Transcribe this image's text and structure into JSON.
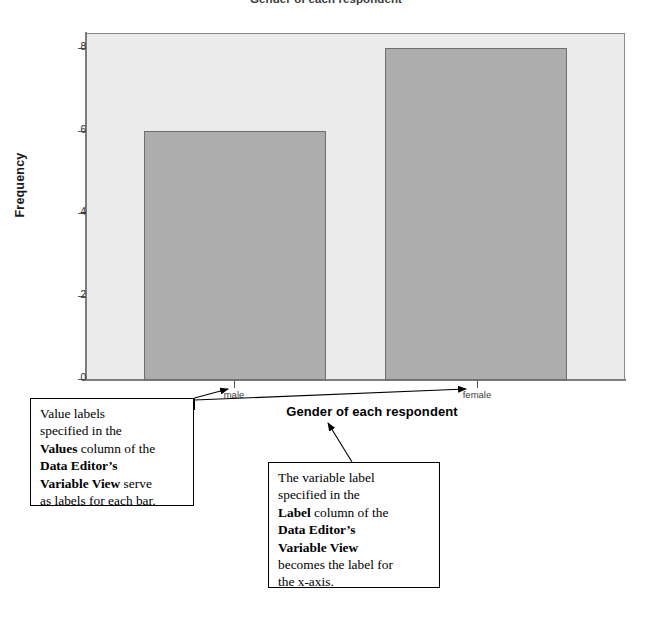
{
  "chart_data": {
    "type": "bar",
    "title": "Gender of each respondent",
    "xlabel": "Gender of each respondent",
    "ylabel": "Frequency",
    "categories": [
      "male",
      "female"
    ],
    "values": [
      6,
      8
    ],
    "yticks": [
      "0",
      "2",
      "4",
      "6",
      "8"
    ],
    "ytick_values": [
      0,
      2,
      4,
      6,
      8
    ],
    "ylim": [
      0,
      8.35
    ],
    "grid": false,
    "legend": "none",
    "bar_color": "#adadad",
    "bar_border_color": "#6f6f6f",
    "plot_background": "#ebebeb"
  },
  "annotations": {
    "left_callout": {
      "name": "value-labels-callout",
      "lines": [
        {
          "runs": [
            {
              "text": "Value labels",
              "bold": false
            }
          ]
        },
        {
          "runs": [
            {
              "text": "specified in the",
              "bold": false
            }
          ]
        },
        {
          "runs": [
            {
              "text": "Values",
              "bold": true
            },
            {
              "text": " column of the",
              "bold": false
            }
          ]
        },
        {
          "runs": [
            {
              "text": "Data Editor’s",
              "bold": true
            }
          ]
        },
        {
          "runs": [
            {
              "text": "Variable View",
              "bold": true
            },
            {
              "text": " serve",
              "bold": false
            }
          ]
        },
        {
          "runs": [
            {
              "text": "as labels for each bar.",
              "bold": false
            }
          ]
        }
      ]
    },
    "right_callout": {
      "name": "variable-label-callout",
      "lines": [
        {
          "runs": [
            {
              "text": "The variable label",
              "bold": false
            }
          ]
        },
        {
          "runs": [
            {
              "text": "specified in the",
              "bold": false
            }
          ]
        },
        {
          "runs": [
            {
              "text": "Label",
              "bold": true
            },
            {
              "text": " column of the",
              "bold": false
            }
          ]
        },
        {
          "runs": [
            {
              "text": "Data Editor’s",
              "bold": true
            }
          ]
        },
        {
          "runs": [
            {
              "text": "Variable View",
              "bold": true
            }
          ]
        },
        {
          "runs": [
            {
              "text": "becomes the label for",
              "bold": false
            }
          ]
        },
        {
          "runs": [
            {
              "text": "the x-axis.",
              "bold": false
            }
          ]
        }
      ]
    }
  }
}
